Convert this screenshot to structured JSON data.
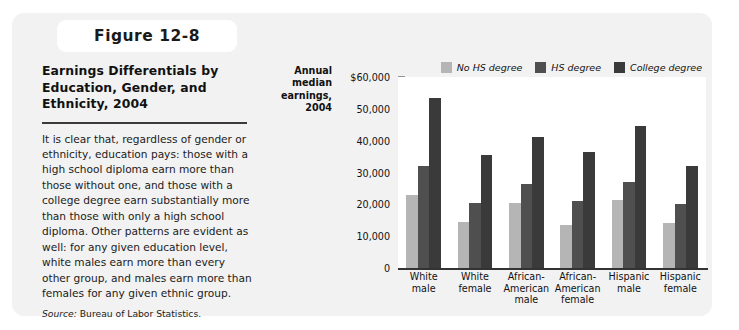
{
  "figure": {
    "tab_label": "Figure 12-8",
    "title": "Earnings Differentials by Education, Gender, and Ethnicity, 2004",
    "body": "It is clear that, regardless of gender or ethnicity, education pays: those with a high school diploma earn more than those without one, and those with a college degree earn substantially more than those with only a high school diploma. Other patterns are evident as well: for any given education level, white males earn more than every other group, and males earn more than females for any given ethnic group.",
    "source_label": "Source:",
    "source_text": " Bureau of Labor Statistics."
  },
  "colors": {
    "panel_background": "#f2f2f2",
    "plot_background": "#ffffff",
    "no_hs_degree": "#b5b5b5",
    "hs_degree": "#4f4f4f",
    "college_degree": "#3a3a3a",
    "axis": "#333333",
    "text": "#111111"
  },
  "chart_data": {
    "type": "bar",
    "title": "Earnings Differentials by Education, Gender, and Ethnicity, 2004",
    "xlabel": "",
    "ylabel": "Annual median earnings, 2004",
    "ylabel_lines": [
      "Annual",
      "median",
      "earnings,",
      "2004"
    ],
    "ylim": [
      0,
      60000
    ],
    "grid": false,
    "legend_position": "top-right",
    "y_ticks": [
      0,
      10000,
      20000,
      30000,
      40000,
      50000,
      60000
    ],
    "y_tick_labels": [
      "0",
      "10,000",
      "20,000",
      "30,000",
      "40,000",
      "50,000",
      "$60,000"
    ],
    "categories": [
      "White male",
      "White female",
      "African-American male",
      "African-American female",
      "Hispanic male",
      "Hispanic female"
    ],
    "category_lines": [
      [
        "White",
        "male"
      ],
      [
        "White",
        "female"
      ],
      [
        "African-",
        "American",
        "male"
      ],
      [
        "African-",
        "American",
        "female"
      ],
      [
        "Hispanic",
        "male"
      ],
      [
        "Hispanic",
        "female"
      ]
    ],
    "series": [
      {
        "name": "No HS degree",
        "color": "#b5b5b5",
        "values": [
          23000,
          14500,
          20500,
          13500,
          21500,
          14000
        ]
      },
      {
        "name": "HS degree",
        "color": "#4f4f4f",
        "values": [
          32000,
          20500,
          26500,
          21000,
          27000,
          20000
        ]
      },
      {
        "name": "College degree",
        "color": "#3a3a3a",
        "values": [
          53300,
          35500,
          41000,
          36500,
          44500,
          32000
        ]
      }
    ]
  }
}
